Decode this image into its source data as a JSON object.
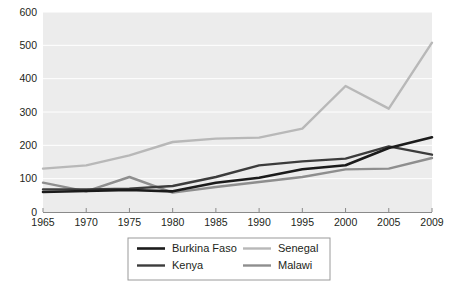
{
  "chart_data": {
    "type": "line",
    "title": "",
    "subtitle": "",
    "xlabel": "",
    "ylabel": "",
    "x": [
      1965,
      1970,
      1975,
      1980,
      1985,
      1990,
      1995,
      2000,
      2005,
      2009
    ],
    "categories": [
      "1965",
      "1970",
      "1975",
      "1980",
      "1985",
      "1990",
      "1995",
      "2000",
      "2005",
      "2009"
    ],
    "xlim": [
      1965,
      2009
    ],
    "ylim": [
      0,
      600
    ],
    "ytick_values": [
      0,
      100,
      200,
      300,
      400,
      500,
      600
    ],
    "ytick_labels": [
      "0",
      "100",
      "200",
      "300",
      "400",
      "500",
      "600"
    ],
    "grid": true,
    "grid_axis": "y",
    "grid_color": "#ffffff",
    "plot_background": "#ececec",
    "legend_position": "below",
    "series": [
      {
        "name": "Burkina Faso",
        "color": "#1b1b1b",
        "width": 2.6,
        "values": [
          60,
          63,
          66,
          62,
          88,
          103,
          128,
          140,
          192,
          224
        ]
      },
      {
        "name": "Senegal",
        "color": "#b8b8b8",
        "width": 2.4,
        "values": [
          130,
          140,
          170,
          210,
          220,
          223,
          250,
          378,
          310,
          508
        ]
      },
      {
        "name": "Kenya",
        "color": "#3c3c3c",
        "width": 2.4,
        "values": [
          68,
          68,
          70,
          78,
          105,
          140,
          152,
          160,
          197,
          172
        ]
      },
      {
        "name": "Malawi",
        "color": "#8e8e8e",
        "width": 2.4,
        "values": [
          88,
          62,
          105,
          58,
          75,
          90,
          105,
          128,
          130,
          162
        ]
      }
    ]
  },
  "legend": {
    "entries": [
      {
        "label": "Burkina Faso"
      },
      {
        "label": "Senegal"
      },
      {
        "label": "Kenya"
      },
      {
        "label": "Malawi"
      }
    ]
  },
  "axes": {
    "axis_color": "#8a8a8a",
    "tick_color": "#8a8a8a"
  }
}
